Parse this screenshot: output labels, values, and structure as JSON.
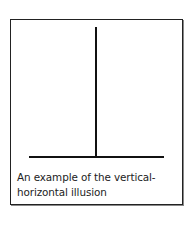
{
  "figure": {
    "caption_lines": [
      "An example of the vertical-",
      "horizontal illusion"
    ],
    "line_color": "#111111",
    "border_color": "#222222"
  }
}
